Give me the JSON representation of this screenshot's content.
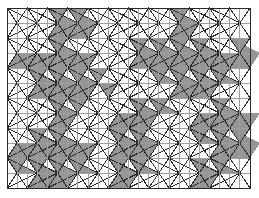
{
  "figure": {
    "name": "triangular-lattice-percolation-diagram",
    "type": "lattice-diagram",
    "width": 259,
    "height": 198,
    "background_color": "#ffffff"
  },
  "lattice": {
    "shape": "triangular",
    "columns": 12,
    "rows": 12,
    "origin_x": 7,
    "origin_y": 8,
    "cell_width": 20.25,
    "cell_height": 15.0,
    "line_color_dark": "#2b2b2b",
    "line_color_mid": "#555555",
    "line_color_light": "#9e9e9e",
    "line_width_vertical": 1.0,
    "line_width_diagonal": 1.0,
    "fill_color": "#8f8f8f",
    "fill_opacity": 0.95,
    "border_color": "#6a6a6a"
  },
  "chart_data": {
    "type": "heatmap",
    "title": "",
    "xlabel": "",
    "ylabel": "",
    "grid": true,
    "legend": null,
    "categories": [
      "col0",
      "col1",
      "col2",
      "col3",
      "col4",
      "col5",
      "col6",
      "col7",
      "col8",
      "col9",
      "col10",
      "col11"
    ],
    "x": [
      0,
      1,
      2,
      3,
      4,
      5,
      6,
      7,
      8,
      9,
      10,
      11
    ],
    "y": [
      0,
      1,
      2,
      3,
      4,
      5,
      6,
      7,
      8,
      9,
      10,
      11
    ],
    "filled_up_triangles": [
      [
        2,
        0
      ],
      [
        3,
        0
      ],
      [
        8,
        0
      ],
      [
        2,
        1
      ],
      [
        3,
        1
      ],
      [
        8,
        1
      ],
      [
        2,
        2
      ],
      [
        6,
        2
      ],
      [
        7,
        2
      ],
      [
        8,
        2
      ],
      [
        9,
        2
      ],
      [
        11,
        2
      ],
      [
        0,
        3
      ],
      [
        1,
        3
      ],
      [
        2,
        3
      ],
      [
        3,
        3
      ],
      [
        6,
        3
      ],
      [
        7,
        3
      ],
      [
        8,
        3
      ],
      [
        9,
        3
      ],
      [
        10,
        3
      ],
      [
        11,
        3
      ],
      [
        1,
        4
      ],
      [
        2,
        4
      ],
      [
        3,
        4
      ],
      [
        4,
        4
      ],
      [
        7,
        4
      ],
      [
        8,
        4
      ],
      [
        9,
        4
      ],
      [
        10,
        4
      ],
      [
        1,
        5
      ],
      [
        2,
        5
      ],
      [
        3,
        5
      ],
      [
        4,
        5
      ],
      [
        8,
        5
      ],
      [
        9,
        5
      ],
      [
        2,
        6
      ],
      [
        3,
        6
      ],
      [
        6,
        6
      ],
      [
        7,
        6
      ],
      [
        10,
        6
      ],
      [
        2,
        7
      ],
      [
        5,
        7
      ],
      [
        6,
        7
      ],
      [
        9,
        7
      ],
      [
        10,
        7
      ],
      [
        11,
        7
      ],
      [
        1,
        8
      ],
      [
        2,
        8
      ],
      [
        5,
        8
      ],
      [
        6,
        8
      ],
      [
        9,
        8
      ],
      [
        10,
        8
      ],
      [
        11,
        8
      ],
      [
        0,
        9
      ],
      [
        1,
        9
      ],
      [
        2,
        9
      ],
      [
        3,
        9
      ],
      [
        5,
        9
      ],
      [
        6,
        9
      ],
      [
        10,
        9
      ],
      [
        11,
        9
      ],
      [
        0,
        10
      ],
      [
        1,
        10
      ],
      [
        2,
        10
      ],
      [
        3,
        10
      ],
      [
        5,
        10
      ],
      [
        6,
        10
      ],
      [
        9,
        10
      ],
      [
        10,
        10
      ],
      [
        1,
        11
      ],
      [
        2,
        11
      ],
      [
        5,
        11
      ],
      [
        9,
        11
      ]
    ],
    "filled_down_triangles": [
      [
        2,
        0
      ],
      [
        3,
        0
      ],
      [
        8,
        0
      ],
      [
        2,
        1
      ],
      [
        3,
        1
      ],
      [
        8,
        1
      ],
      [
        2,
        2
      ],
      [
        6,
        2
      ],
      [
        7,
        2
      ],
      [
        8,
        2
      ],
      [
        9,
        2
      ],
      [
        11,
        2
      ],
      [
        0,
        3
      ],
      [
        1,
        3
      ],
      [
        2,
        3
      ],
      [
        3,
        3
      ],
      [
        6,
        3
      ],
      [
        7,
        3
      ],
      [
        8,
        3
      ],
      [
        9,
        3
      ],
      [
        10,
        3
      ],
      [
        11,
        3
      ],
      [
        1,
        4
      ],
      [
        2,
        4
      ],
      [
        3,
        4
      ],
      [
        7,
        4
      ],
      [
        8,
        4
      ],
      [
        9,
        4
      ],
      [
        10,
        4
      ],
      [
        1,
        5
      ],
      [
        2,
        5
      ],
      [
        3,
        5
      ],
      [
        8,
        5
      ],
      [
        9,
        5
      ],
      [
        2,
        6
      ],
      [
        6,
        6
      ],
      [
        7,
        6
      ],
      [
        10,
        6
      ],
      [
        2,
        7
      ],
      [
        5,
        7
      ],
      [
        6,
        7
      ],
      [
        9,
        7
      ],
      [
        10,
        7
      ],
      [
        11,
        7
      ],
      [
        1,
        8
      ],
      [
        2,
        8
      ],
      [
        5,
        8
      ],
      [
        6,
        8
      ],
      [
        9,
        8
      ],
      [
        10,
        8
      ],
      [
        11,
        8
      ],
      [
        0,
        9
      ],
      [
        1,
        9
      ],
      [
        2,
        9
      ],
      [
        3,
        9
      ],
      [
        5,
        9
      ],
      [
        6,
        9
      ],
      [
        10,
        9
      ],
      [
        11,
        9
      ],
      [
        0,
        10
      ],
      [
        1,
        10
      ],
      [
        2,
        10
      ],
      [
        3,
        10
      ],
      [
        5,
        10
      ],
      [
        6,
        10
      ],
      [
        9,
        10
      ],
      [
        10,
        10
      ],
      [
        1,
        11
      ],
      [
        2,
        11
      ],
      [
        5,
        11
      ],
      [
        9,
        11
      ]
    ]
  }
}
